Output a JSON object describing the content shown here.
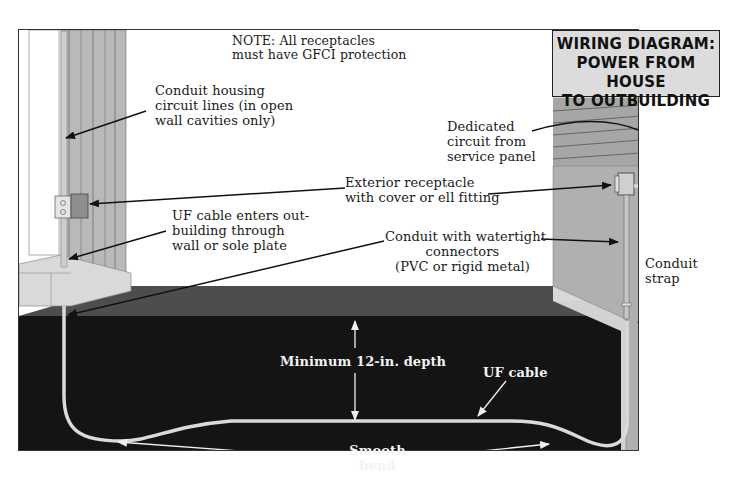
{
  "title": {
    "lines": [
      "WIRING DIAGRAM:",
      "POWER FROM HOUSE",
      "TO OUTBUILDING"
    ]
  },
  "note": {
    "lines": [
      "NOTE: All receptacles",
      "must have GFCI protection"
    ]
  },
  "callouts": {
    "conduit_housing": [
      "Conduit housing",
      "circuit lines (in open",
      "wall cavities only)"
    ],
    "dedicated_circuit": [
      "Dedicated",
      "circuit from",
      "service panel"
    ],
    "exterior_receptacle": [
      "Exterior receptacle",
      "with cover or ell fitting"
    ],
    "uf_enters": [
      "UF cable enters out-",
      "building through",
      "wall or sole plate"
    ],
    "conduit_watertight": [
      "Conduit with watertight",
      "connectors",
      "(PVC or rigid metal)"
    ],
    "conduit_strap": [
      "Conduit",
      "strap"
    ],
    "min_depth": "Minimum 12-in. depth",
    "uf_cable": "UF cable",
    "smooth_bend": [
      "Smooth",
      "bend"
    ]
  },
  "colors": {
    "soil_dark": "#141414",
    "ground_surface": "#4a4a4a",
    "wall_light": "#d6d6d6",
    "wall_mid": "#a8a8a8",
    "cable": "#d8d8d8",
    "title_bg": "#dcdcdc"
  }
}
